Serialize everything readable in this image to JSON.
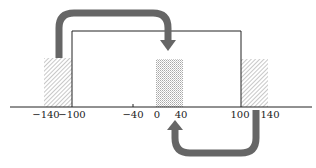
{
  "diagram": {
    "type": "number-line-shift",
    "axis": {
      "ticks": [
        {
          "value": -140,
          "label": "−140"
        },
        {
          "value": -100,
          "label": "−100"
        },
        {
          "value": -40,
          "label": "−40"
        },
        {
          "value": 0,
          "label": "0"
        },
        {
          "value": 40,
          "label": "40"
        },
        {
          "value": 100,
          "label": "100"
        },
        {
          "value": 140,
          "label": "140"
        }
      ]
    },
    "rectangle": {
      "from": -100,
      "to": 100
    },
    "regions": [
      {
        "name": "left-hatched",
        "from": -140,
        "to": -100,
        "pattern": "diagonal-hatch"
      },
      {
        "name": "center-dotted",
        "from": 0,
        "to": 40,
        "pattern": "dotted"
      },
      {
        "name": "right-hatched",
        "from": 100,
        "to": 140,
        "pattern": "diagonal-hatch"
      }
    ],
    "arrows": [
      {
        "name": "upper-arrow",
        "from_region": "left-hatched",
        "to_region": "center-dotted",
        "direction": "over"
      },
      {
        "name": "lower-arrow",
        "from_region": "right-hatched",
        "to_region": "center-dotted",
        "direction": "under"
      }
    ],
    "colors": {
      "arrow": "#666666",
      "line": "#222222",
      "hatch": "#9a9a9a",
      "dot": "#aaaaaa"
    }
  }
}
